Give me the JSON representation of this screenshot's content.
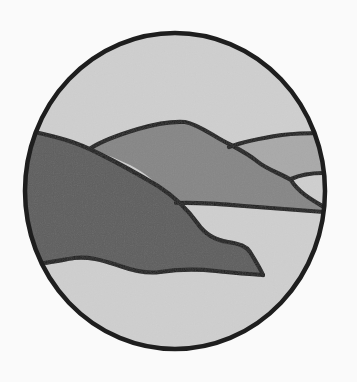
{
  "illustration": {
    "subject": "circular landscape vignette with layered hills and water",
    "canvas": {
      "width": 357,
      "height": 382,
      "background": "#fafafa"
    },
    "frame": {
      "shape": "circle",
      "cx": 175,
      "cy": 191,
      "rx": 150,
      "ry": 158,
      "stroke": "#1e1e1e",
      "stroke_width": 4.5
    },
    "colors": {
      "sky_water": "#cfcfcf",
      "far_hill": "#a9a9a9",
      "middle_hill": "#868686",
      "near_hill": "#5f5f5f",
      "outline": "#222222"
    },
    "layers": [
      {
        "name": "far-hill",
        "fill": "#a9a9a9"
      },
      {
        "name": "middle-hill",
        "fill": "#868686"
      },
      {
        "name": "near-hill",
        "fill": "#5f5f5f"
      }
    ]
  }
}
